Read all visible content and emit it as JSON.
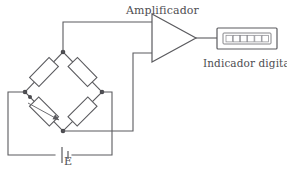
{
  "diagram": {
    "labels": {
      "amplifier": "Amplificador",
      "indicator": "Indicador digital",
      "source": "E"
    },
    "colors": {
      "background": "#ffffff",
      "wire": "#5b5b5f",
      "node": "#4a4a4e",
      "text": "#4e4e52"
    },
    "components": {
      "bridge": {
        "name": "wheatstone-bridge",
        "shape": "diamond",
        "nodes": {
          "top": {
            "x": 63,
            "y": 52
          },
          "right": {
            "x": 102,
            "y": 92
          },
          "bottom": {
            "x": 63,
            "y": 131
          },
          "left": {
            "x": 25,
            "y": 92
          }
        },
        "resistors": [
          {
            "name": "resistor-top-left",
            "variable": false
          },
          {
            "name": "resistor-top-right",
            "variable": false
          },
          {
            "name": "resistor-bottom-right",
            "variable": false
          },
          {
            "name": "resistor-bottom-left-strain-gauge",
            "variable": true
          }
        ]
      },
      "amplifier": {
        "name": "amplifier",
        "symbol": "triangle",
        "inputs": 2,
        "outputs": 1
      },
      "indicator": {
        "name": "digital-indicator",
        "digit_count": 6
      },
      "source": {
        "name": "dc-voltage-source",
        "symbol": "battery"
      }
    }
  }
}
